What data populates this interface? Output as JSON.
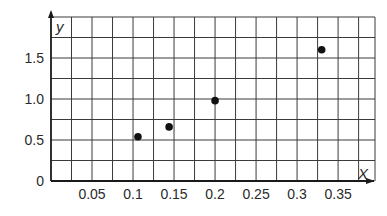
{
  "chart_data": {
    "type": "scatter",
    "title": "",
    "xlabel": "X",
    "ylabel": "y",
    "xlim": [
      0,
      0.4
    ],
    "ylim": [
      0,
      2.0
    ],
    "grid": true,
    "grid_step_x": 0.025,
    "grid_step_y": 0.25,
    "x_ticks": [
      {
        "value": 0.05,
        "label": "0.05"
      },
      {
        "value": 0.1,
        "label": "0.1"
      },
      {
        "value": 0.15,
        "label": "0.15"
      },
      {
        "value": 0.2,
        "label": "0.2"
      },
      {
        "value": 0.25,
        "label": "0.25"
      },
      {
        "value": 0.3,
        "label": "0.3"
      },
      {
        "value": 0.35,
        "label": "0.35"
      }
    ],
    "y_ticks": [
      {
        "value": 0,
        "label": "0"
      },
      {
        "value": 0.5,
        "label": "0.5"
      },
      {
        "value": 1.0,
        "label": "1.0"
      },
      {
        "value": 1.5,
        "label": "1.5"
      }
    ],
    "points": [
      {
        "x": 0.106,
        "y": 0.54
      },
      {
        "x": 0.144,
        "y": 0.66
      },
      {
        "x": 0.2,
        "y": 0.98
      },
      {
        "x": 0.33,
        "y": 1.6
      }
    ],
    "series": [
      {
        "name": "data",
        "x": [
          0.106,
          0.144,
          0.2,
          0.33
        ],
        "y": [
          0.54,
          0.66,
          0.98,
          1.6
        ],
        "marker": "filled-circle",
        "color": "#111111"
      }
    ]
  }
}
